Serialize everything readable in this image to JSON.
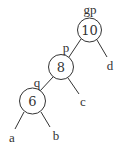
{
  "diagram": {
    "type": "binary-tree",
    "colors": {
      "stroke": "#333333",
      "background": "#ffffff",
      "text": "#333333"
    },
    "nodes": [
      {
        "id": "gp",
        "value": "10",
        "role_label": "gp",
        "cx": 89.5,
        "cy": 30,
        "r": 12
      },
      {
        "id": "p",
        "value": "8",
        "role_label": "p",
        "cx": 61,
        "cy": 67,
        "r": 12.5
      },
      {
        "id": "q",
        "value": "6",
        "role_label": "q",
        "cx": 32.5,
        "cy": 101,
        "r": 13
      }
    ],
    "subtrees": [
      {
        "id": "a",
        "label": "a"
      },
      {
        "id": "b",
        "label": "b"
      },
      {
        "id": "c",
        "label": "c"
      },
      {
        "id": "d",
        "label": "d"
      }
    ],
    "edges": [
      {
        "from": "gp",
        "to": "p"
      },
      {
        "from": "gp",
        "to": "d"
      },
      {
        "from": "p",
        "to": "q"
      },
      {
        "from": "p",
        "to": "c"
      },
      {
        "from": "q",
        "to": "a"
      },
      {
        "from": "q",
        "to": "b"
      }
    ]
  }
}
